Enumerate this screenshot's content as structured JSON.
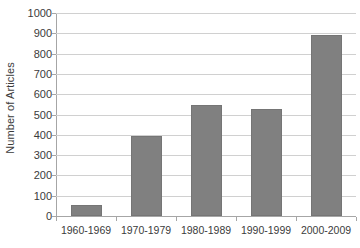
{
  "chart_data": {
    "type": "bar",
    "title": "",
    "xlabel": "",
    "ylabel": "Number of Articles",
    "categories": [
      "1960-1969",
      "1970-1979",
      "1980-1989",
      "1990-1999",
      "2000-2009"
    ],
    "values": [
      54,
      395,
      545,
      525,
      890
    ],
    "series": [
      {
        "name": "Number of Articles",
        "values": [
          54,
          395,
          545,
          525,
          890
        ]
      }
    ],
    "ylim": [
      0,
      1000
    ],
    "y_ticks": [
      0,
      100,
      200,
      300,
      400,
      500,
      600,
      700,
      800,
      900,
      1000
    ],
    "y_tick_labels": [
      "0",
      "100",
      "200",
      "300",
      "400",
      "500",
      "600",
      "700",
      "800",
      "900",
      "1000"
    ],
    "grid": true,
    "grid_axis": "y",
    "legend": false,
    "legend_position": "none",
    "bar_color": "#808080",
    "bar_border_color": "#757575",
    "gridline_color": "#d0d0d0",
    "axis_color": "#a6a6a6",
    "text_color": "#3b3b3b",
    "background_color": "#ffffff"
  }
}
